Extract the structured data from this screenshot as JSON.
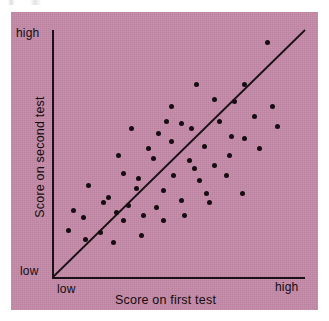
{
  "figure": {
    "panel_color": "#c389a6",
    "ink_color": "#160d12",
    "page_color": "#ffffff"
  },
  "axes": {
    "y_high_label": "high",
    "y_low_label": "low",
    "x_low_label": "low",
    "x_high_label": "high",
    "x_title": "Score on first test",
    "y_title": "Score on second test"
  },
  "chart_data": {
    "type": "scatter",
    "title": "",
    "xlabel": "Score on first test",
    "ylabel": "Score on second test",
    "xlim": [
      0,
      100
    ],
    "ylim": [
      0,
      100
    ],
    "x_tick_labels": [
      "low",
      "high"
    ],
    "y_tick_labels": [
      "low",
      "high"
    ],
    "grid": false,
    "legend": null,
    "annotations": [
      {
        "type": "reference-line",
        "description": "45-degree diagonal identity line from origin to upper right",
        "from": [
          0,
          0
        ],
        "to": [
          100,
          100
        ]
      }
    ],
    "series": [
      {
        "name": "test-takers",
        "marker": "filled-circle",
        "color": "#160d12",
        "n": 55,
        "points": [
          [
            85.0,
            95.0
          ],
          [
            57.0,
            78.0
          ],
          [
            76.0,
            78.0
          ],
          [
            64.0,
            72.0
          ],
          [
            72.0,
            71.0
          ],
          [
            47.0,
            69.0
          ],
          [
            87.0,
            69.0
          ],
          [
            80.0,
            65.0
          ],
          [
            51.0,
            62.0
          ],
          [
            89.0,
            61.0
          ],
          [
            31.0,
            60.0
          ],
          [
            42.0,
            58.0
          ],
          [
            71.0,
            57.0
          ],
          [
            76.0,
            56.0
          ],
          [
            47.0,
            55.0
          ],
          [
            60.0,
            53.0
          ],
          [
            82.0,
            52.0
          ],
          [
            26.0,
            49.0
          ],
          [
            40.0,
            48.0
          ],
          [
            54.0,
            47.0
          ],
          [
            64.0,
            45.0
          ],
          [
            28.0,
            42.0
          ],
          [
            48.0,
            41.0
          ],
          [
            69.0,
            41.0
          ],
          [
            34.0,
            40.0
          ],
          [
            58.0,
            39.0
          ],
          [
            14.0,
            37.0
          ],
          [
            33.0,
            36.0
          ],
          [
            44.0,
            35.0
          ],
          [
            61.0,
            34.0
          ],
          [
            75.0,
            34.0
          ],
          [
            22.0,
            32.0
          ],
          [
            51.0,
            31.0
          ],
          [
            20.0,
            30.0
          ],
          [
            30.0,
            29.0
          ],
          [
            41.0,
            28.0
          ],
          [
            8.0,
            27.0
          ],
          [
            25.0,
            26.0
          ],
          [
            36.0,
            25.0
          ],
          [
            52.0,
            25.0
          ],
          [
            12.0,
            24.0
          ],
          [
            28.0,
            23.0
          ],
          [
            44.0,
            23.0
          ],
          [
            6.0,
            19.0
          ],
          [
            19.0,
            18.0
          ],
          [
            35.0,
            17.0
          ],
          [
            13.0,
            15.0
          ],
          [
            24.0,
            14.0
          ],
          [
            55.0,
            60.0
          ],
          [
            66.0,
            63.0
          ],
          [
            38.0,
            52.0
          ],
          [
            56.0,
            44.0
          ],
          [
            70.0,
            49.0
          ],
          [
            45.0,
            63.0
          ],
          [
            62.0,
            30.0
          ]
        ]
      }
    ]
  }
}
